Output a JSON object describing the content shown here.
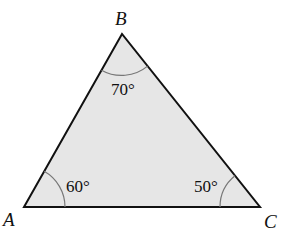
{
  "diagram": {
    "type": "triangle",
    "fill_color": "#e6e6e6",
    "stroke_color": "#111111",
    "arc_color": "#777777",
    "vertices": [
      {
        "name": "A",
        "label": "A",
        "x": 24,
        "y": 207
      },
      {
        "name": "B",
        "label": "B",
        "x": 122,
        "y": 34
      },
      {
        "name": "C",
        "label": "C",
        "x": 260,
        "y": 207
      }
    ],
    "angles": [
      {
        "vertex": "A",
        "label": "60°"
      },
      {
        "vertex": "B",
        "label": "70°"
      },
      {
        "vertex": "C",
        "label": "50°"
      }
    ]
  }
}
